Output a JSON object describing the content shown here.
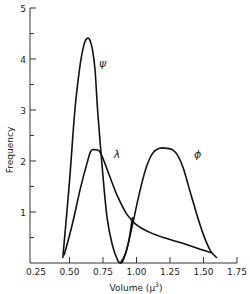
{
  "chart_data": {
    "type": "line",
    "title": "",
    "xlabel": "Volume (μ³)",
    "ylabel": "Frequency",
    "xlim": [
      0.25,
      1.75
    ],
    "ylim": [
      0,
      5
    ],
    "grid": false,
    "legend": "inline curve labels",
    "x_ticks": [
      "0.25",
      "0.50",
      "0.75",
      "1.00",
      "1.25",
      "1.50",
      "1.75"
    ],
    "y_ticks": [
      "1",
      "2",
      "3",
      "4",
      "5"
    ],
    "series": [
      {
        "name": "ψ",
        "label_pos": [
          0.72,
          3.85
        ],
        "x": [
          0.45,
          0.5,
          0.54,
          0.58,
          0.61,
          0.63,
          0.65,
          0.67,
          0.69,
          0.71,
          0.74,
          0.78,
          0.82,
          0.86,
          0.88,
          0.9,
          0.94,
          0.97
        ],
        "y": [
          0.1,
          1.6,
          3.0,
          3.9,
          4.3,
          4.4,
          4.38,
          4.2,
          3.8,
          3.0,
          2.0,
          0.9,
          0.35,
          0.05,
          0.0,
          0.05,
          0.4,
          0.9
        ]
      },
      {
        "name": "λ",
        "label_pos": [
          0.83,
          2.05
        ],
        "x": [
          0.46,
          0.52,
          0.58,
          0.63,
          0.66,
          0.69,
          0.72,
          0.75,
          0.8,
          0.86,
          0.93,
          1.0,
          1.1,
          1.2,
          1.3,
          1.4,
          1.5,
          1.56
        ],
        "y": [
          0.15,
          0.75,
          1.45,
          1.95,
          2.2,
          2.22,
          2.2,
          2.05,
          1.7,
          1.3,
          0.95,
          0.75,
          0.6,
          0.5,
          0.42,
          0.34,
          0.25,
          0.2
        ]
      },
      {
        "name": "ϕ",
        "label_pos": [
          1.43,
          2.05
        ],
        "x": [
          0.88,
          0.92,
          0.97,
          1.02,
          1.07,
          1.12,
          1.17,
          1.22,
          1.27,
          1.31,
          1.35,
          1.4,
          1.45,
          1.5,
          1.55,
          1.6
        ],
        "y": [
          0.0,
          0.2,
          0.75,
          1.35,
          1.85,
          2.15,
          2.25,
          2.25,
          2.22,
          2.1,
          1.85,
          1.4,
          0.95,
          0.55,
          0.25,
          0.1
        ]
      }
    ]
  },
  "axes": {
    "x_label": "Volume (μ",
    "x_label_sup": "3",
    "x_label_close": ")",
    "y_label": "Frequency"
  }
}
